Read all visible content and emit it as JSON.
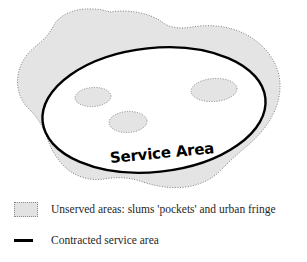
{
  "figure": {
    "title": "",
    "type": "schematic-map"
  },
  "map": {
    "service_area_label": "Service Area",
    "unserved_blob_name": "unserved-area-blob",
    "pockets": [
      {
        "name": "pocket-left"
      },
      {
        "name": "pocket-right"
      },
      {
        "name": "pocket-center"
      }
    ]
  },
  "legend": {
    "items": [
      {
        "swatch": "gray-dotted-box",
        "label": "Unserved areas: slums 'pockets' and urban fringe"
      },
      {
        "swatch": "thick-black-line",
        "label": "Contracted service area"
      }
    ]
  },
  "colors": {
    "unserved_fill": "#e4e4e4",
    "unserved_stroke": "#7d7d7d",
    "service_boundary": "#000000",
    "background": "#ffffff",
    "text": "#1f1f1f"
  }
}
